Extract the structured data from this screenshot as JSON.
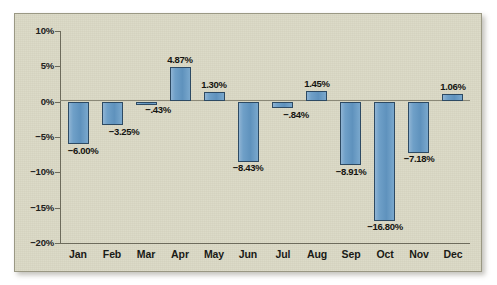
{
  "chart_data": {
    "type": "bar",
    "title": "",
    "subtitle": "",
    "xlabel": "",
    "ylabel": "",
    "categories": [
      "Jan",
      "Feb",
      "Mar",
      "Apr",
      "May",
      "Jun",
      "Jul",
      "Aug",
      "Sep",
      "Oct",
      "Nov",
      "Dec"
    ],
    "values": [
      -6.0,
      -3.25,
      -0.43,
      4.87,
      1.3,
      -8.43,
      -0.84,
      1.45,
      -8.91,
      -16.8,
      -7.18,
      1.06
    ],
    "data_labels": [
      "-6.00%",
      "-3.25%",
      "-.43%",
      "4.87%",
      "1.30%",
      "-8.43%",
      "-.84%",
      "1.45%",
      "-8.91%",
      "-16.80%",
      "-7.18%",
      "1.06%"
    ],
    "ylim": [
      -20,
      10
    ],
    "yticks": [
      10,
      5,
      0,
      -5,
      -10,
      -15,
      -20
    ],
    "ytick_labels": [
      "10%",
      "5%",
      "0%",
      "-5%",
      "-10%",
      "-15%",
      "-20%"
    ],
    "grid": false,
    "legend": null,
    "series": [
      {
        "name": "Monthly change",
        "values": [
          -6.0,
          -3.25,
          -0.43,
          4.87,
          1.3,
          -8.43,
          -0.84,
          1.45,
          -8.91,
          -16.8,
          -7.18,
          1.06
        ]
      }
    ],
    "colors": {
      "bar_fill": "#6fa0c8",
      "bar_stroke": "#2d4a63",
      "background": "#d9d7c3",
      "axis": "#6d6b5c",
      "text": "#1a1a16"
    }
  }
}
